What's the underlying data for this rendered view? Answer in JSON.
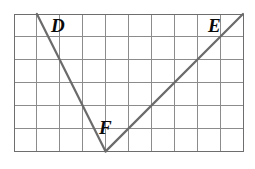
{
  "figure": {
    "background_color": "#ffffff",
    "grid": {
      "columns": 10,
      "rows": 6,
      "cell_size": 22.9,
      "origin_x": 14,
      "origin_y": 14,
      "line_color": "#8c8c8c",
      "border_color": "#6e6e6e",
      "line_width": 1
    },
    "rays": {
      "stroke_color": "#6b6b6b",
      "stroke_width": 2.2,
      "segments": [
        {
          "name": "segment-DF",
          "from": "D",
          "to": "F"
        },
        {
          "name": "segment-FE",
          "from": "F",
          "to": "E"
        }
      ]
    },
    "points": [
      {
        "id": "D",
        "label": "D",
        "grid_col": 1,
        "grid_row": 0,
        "x": 36.9,
        "y": 14,
        "label_x": 51,
        "label_y": 16,
        "font_size": 19
      },
      {
        "id": "E",
        "label": "E",
        "grid_col": 10,
        "grid_row": 0,
        "x": 243,
        "y": 14,
        "label_x": 208,
        "label_y": 16,
        "font_size": 19
      },
      {
        "id": "F",
        "label": "F",
        "grid_col": 4,
        "grid_row": 6,
        "x": 105.6,
        "y": 151.4,
        "label_x": 99,
        "label_y": 118,
        "font_size": 19
      }
    ]
  }
}
